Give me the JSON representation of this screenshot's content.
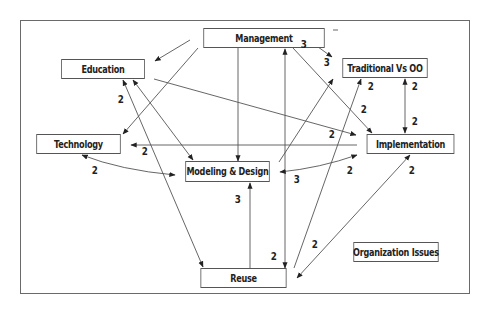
{
  "diagram": {
    "legend_box": "Organization Issues",
    "nodes": [
      {
        "id": "management",
        "label": "Management"
      },
      {
        "id": "education",
        "label": "Education"
      },
      {
        "id": "traditional",
        "label": "Traditional Vs OO"
      },
      {
        "id": "technology",
        "label": "Technology"
      },
      {
        "id": "implementation",
        "label": "Implementation"
      },
      {
        "id": "modeling",
        "label": "Modeling & Design"
      },
      {
        "id": "reuse",
        "label": "Reuse"
      }
    ],
    "edges": [
      {
        "from": "management",
        "to": "education",
        "weight": ""
      },
      {
        "from": "management",
        "to": "technology",
        "weight": ""
      },
      {
        "from": "management",
        "to": "modeling",
        "weight": ""
      },
      {
        "from": "management",
        "to": "traditional",
        "weight": "3",
        "weight2": "3",
        "bidirectional": true
      },
      {
        "from": "management",
        "to": "implementation",
        "weight": "2"
      },
      {
        "from": "reuse",
        "to": "management",
        "weight": "2",
        "note": "bidirectional vertical line Management-Reuse"
      },
      {
        "from": "education",
        "to": "reuse",
        "weight": "2",
        "bidirectional": true
      },
      {
        "from": "education",
        "to": "modeling",
        "weight": "",
        "bidirectional": true
      },
      {
        "from": "education",
        "to": "implementation",
        "weight": "2"
      },
      {
        "from": "implementation",
        "to": "technology",
        "weight": "2"
      },
      {
        "from": "technology",
        "to": "modeling",
        "weight": "2",
        "bidirectional": true
      },
      {
        "from": "modeling",
        "to": "traditional",
        "weight": ""
      },
      {
        "from": "modeling",
        "to": "implementation",
        "weight": "3",
        "weight2": "2",
        "bidirectional": true
      },
      {
        "from": "reuse",
        "to": "modeling",
        "weight": "3"
      },
      {
        "from": "reuse",
        "to": "traditional",
        "weight": "2"
      },
      {
        "from": "traditional",
        "to": "implementation",
        "weight": "2",
        "weight2": "2",
        "bidirectional": true
      },
      {
        "from": "implementation",
        "to": "reuse",
        "weight": "2",
        "weight2": "2",
        "bidirectional": true
      }
    ],
    "weights": {
      "mgmt_trad_a": "3",
      "mgmt_trad_b": "3",
      "trad_out": "2",
      "trad_impl_top": "2",
      "trad_impl_bottom": "2",
      "mgmt_impl": "2",
      "edu_impl": "2",
      "edu_reuse": "2",
      "impl_tech": "2",
      "tech_model": "2",
      "impl_model_left": "3",
      "impl_model_right": "2",
      "impl_reuse_top": "2",
      "reuse_model": "3",
      "reuse_mgmt": "2",
      "reuse_impl_bottom": "2"
    }
  }
}
